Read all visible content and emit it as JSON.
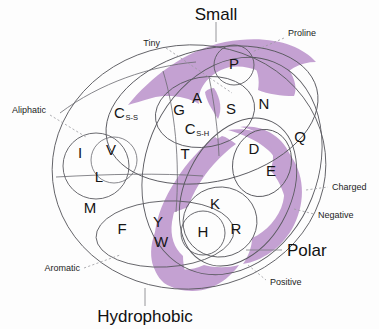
{
  "figure": {
    "background_color": "#fdfdfd",
    "purple_fill": "#c4a1d2",
    "line_color": "#5a5a60"
  },
  "major_labels": {
    "small": "Small",
    "polar": "Polar",
    "hydrophobic": "Hydrophobic"
  },
  "minor_labels": {
    "tiny": "Tiny",
    "proline": "Proline",
    "aliphatic": "Aliphatic",
    "aromatic": "Aromatic",
    "charged": "Charged",
    "negative": "Negative",
    "positive": "Positive"
  },
  "residues": [
    {
      "code": "P",
      "sub": "",
      "x": 234,
      "y": 65,
      "name": "proline"
    },
    {
      "code": "G",
      "sub": "",
      "x": 179,
      "y": 111,
      "name": "glycine"
    },
    {
      "code": "A",
      "sub": "",
      "x": 197,
      "y": 99,
      "name": "alanine"
    },
    {
      "code": "S",
      "sub": "",
      "x": 231,
      "y": 110,
      "name": "serine"
    },
    {
      "code": "N",
      "sub": "",
      "x": 264,
      "y": 105,
      "name": "asparagine"
    },
    {
      "code": "C",
      "sub": "S-S",
      "x": 126,
      "y": 114,
      "name": "cysteine-disulfide"
    },
    {
      "code": "C",
      "sub": "S-H",
      "x": 197,
      "y": 130,
      "name": "cysteine-free-thiol"
    },
    {
      "code": "Q",
      "sub": "",
      "x": 300,
      "y": 138,
      "name": "glutamine"
    },
    {
      "code": "T",
      "sub": "",
      "x": 185,
      "y": 155,
      "name": "threonine"
    },
    {
      "code": "D",
      "sub": "",
      "x": 254,
      "y": 150,
      "name": "aspartate"
    },
    {
      "code": "E",
      "sub": "",
      "x": 271,
      "y": 172,
      "name": "glutamate"
    },
    {
      "code": "I",
      "sub": "",
      "x": 80,
      "y": 154,
      "name": "isoleucine"
    },
    {
      "code": "V",
      "sub": "",
      "x": 111,
      "y": 151,
      "name": "valine"
    },
    {
      "code": "L",
      "sub": "",
      "x": 99,
      "y": 178,
      "name": "leucine"
    },
    {
      "code": "M",
      "sub": "",
      "x": 90,
      "y": 209,
      "name": "methionine"
    },
    {
      "code": "F",
      "sub": "",
      "x": 122,
      "y": 230,
      "name": "phenylalanine"
    },
    {
      "code": "Y",
      "sub": "",
      "x": 158,
      "y": 223,
      "name": "tyrosine"
    },
    {
      "code": "W",
      "sub": "",
      "x": 161,
      "y": 243,
      "name": "tryptophan"
    },
    {
      "code": "K",
      "sub": "",
      "x": 215,
      "y": 205,
      "name": "lysine"
    },
    {
      "code": "H",
      "sub": "",
      "x": 203,
      "y": 233,
      "name": "histidine"
    },
    {
      "code": "R",
      "sub": "",
      "x": 236,
      "y": 230,
      "name": "arginine"
    }
  ],
  "groups": {
    "tiny": [
      "G",
      "A",
      "S",
      "C",
      "P"
    ],
    "small": [
      "P",
      "G",
      "A",
      "S",
      "N",
      "D",
      "T",
      "C",
      "V"
    ],
    "aliphatic": [
      "I",
      "V",
      "L"
    ],
    "aromatic": [
      "F",
      "Y",
      "W",
      "H"
    ],
    "charged": [
      "D",
      "E",
      "K",
      "R",
      "H"
    ],
    "negative": [
      "D",
      "E"
    ],
    "positive": [
      "K",
      "R",
      "H"
    ],
    "polar": [
      "S",
      "N",
      "Q",
      "D",
      "E",
      "K",
      "R",
      "H",
      "T",
      "Y",
      "W",
      "C"
    ],
    "hydrophobic": [
      "I",
      "V",
      "L",
      "M",
      "F",
      "Y",
      "W",
      "C",
      "A",
      "G",
      "T",
      "K",
      "H"
    ]
  }
}
